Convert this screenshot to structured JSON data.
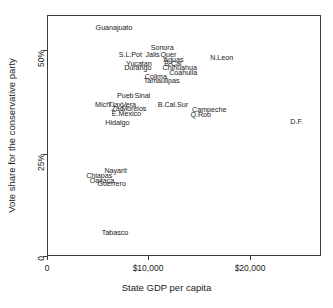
{
  "chart_data": {
    "type": "scatter",
    "title": "",
    "xlabel": "State GDP per capita",
    "ylabel": "Vote share for the conservative party",
    "xlim": [
      0,
      24150
    ],
    "ylim": [
      0,
      0.5975
    ],
    "grid": false,
    "legend": null,
    "xticks": [
      {
        "value": 0,
        "label": "0"
      },
      {
        "value": 10000,
        "label": "$10,000"
      },
      {
        "value": 20000,
        "label": "$20,000"
      }
    ],
    "yticks": [
      {
        "value": 0,
        "label": "0"
      },
      {
        "value": 0.25,
        "label": "25%"
      },
      {
        "value": 0.5,
        "label": "50%"
      }
    ],
    "marker": "text-label",
    "points": [
      {
        "label": "Guanajuato",
        "x": 5900,
        "y": 0.565
      },
      {
        "label": "Sonora",
        "x": 10150,
        "y": 0.516
      },
      {
        "label": "S.L.Pot",
        "x": 7350,
        "y": 0.498
      },
      {
        "label": "Jalis",
        "x": 9300,
        "y": 0.498
      },
      {
        "label": "Quer",
        "x": 10700,
        "y": 0.499
      },
      {
        "label": "Aguas",
        "x": 11150,
        "y": 0.486
      },
      {
        "label": "N.Leon",
        "x": 15400,
        "y": 0.492
      },
      {
        "label": "Yucatan",
        "x": 8100,
        "y": 0.477
      },
      {
        "label": "B.Cal",
        "x": 11100,
        "y": 0.477
      },
      {
        "label": "Durango",
        "x": 8000,
        "y": 0.466
      },
      {
        "label": "Chihuahua",
        "x": 11700,
        "y": 0.466
      },
      {
        "label": "Coahuila",
        "x": 12000,
        "y": 0.454
      },
      {
        "label": "Colima",
        "x": 9600,
        "y": 0.444
      },
      {
        "label": "Tamaulipas",
        "x": 10100,
        "y": 0.434
      },
      {
        "label": "Pueb",
        "x": 6900,
        "y": 0.397
      },
      {
        "label": "Sinal",
        "x": 8400,
        "y": 0.397
      },
      {
        "label": "Mich",
        "x": 4900,
        "y": 0.375
      },
      {
        "label": "Tlax",
        "x": 6000,
        "y": 0.375
      },
      {
        "label": "Vera",
        "x": 7200,
        "y": 0.375
      },
      {
        "label": "B.Cal.Sur",
        "x": 11100,
        "y": 0.375
      },
      {
        "label": "Zac",
        "x": 6200,
        "y": 0.364
      },
      {
        "label": "Morelos",
        "x": 7650,
        "y": 0.364
      },
      {
        "label": "Campeche",
        "x": 14300,
        "y": 0.363
      },
      {
        "label": "E.Mexico",
        "x": 7000,
        "y": 0.352
      },
      {
        "label": "Q.Roo",
        "x": 13550,
        "y": 0.35
      },
      {
        "label": "Hidalgo",
        "x": 6200,
        "y": 0.33
      },
      {
        "label": "D.F.",
        "x": 22000,
        "y": 0.331
      },
      {
        "label": "Nayarit",
        "x": 6050,
        "y": 0.211
      },
      {
        "label": "Chiapas",
        "x": 4600,
        "y": 0.199
      },
      {
        "label": "Oaxaca",
        "x": 4850,
        "y": 0.186
      },
      {
        "label": "Guerrero",
        "x": 5700,
        "y": 0.178
      },
      {
        "label": "Tabasco",
        "x": 6000,
        "y": 0.056
      }
    ]
  },
  "axes": {
    "x_title": "State GDP per capita",
    "y_title": "Vote share for the conservative party",
    "x_tick_labels": [
      "0",
      "$10,000",
      "$20,000"
    ],
    "y_tick_labels": [
      "0",
      "25%",
      "50%"
    ]
  },
  "style": {
    "frame_color": "#3a3a3a",
    "text_color": "#1a1a1a",
    "background": "#ffffff"
  }
}
